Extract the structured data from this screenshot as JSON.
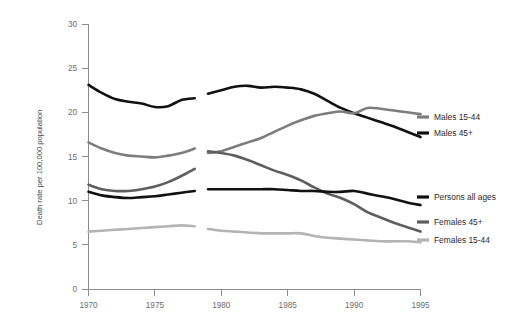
{
  "chart_data": {
    "type": "line",
    "title": "",
    "subtitle": "",
    "xlabel": "",
    "ylabel": "Death rate per 100,000 population",
    "xlim": [
      1970,
      1995
    ],
    "ylim": [
      0,
      30
    ],
    "xticks": [
      1970,
      1975,
      1980,
      1985,
      1990,
      1995
    ],
    "xtick_labels": [
      "1970",
      "1975",
      "1980",
      "1985",
      "1990",
      "1995"
    ],
    "yticks": [
      0,
      5,
      10,
      15,
      20,
      25,
      30
    ],
    "ytick_labels": [
      "0",
      "5",
      "10",
      "15",
      "20",
      "25",
      "30"
    ],
    "grid": false,
    "legend_position": "right",
    "discontinuity": {
      "note": "series are broken between 1978 and 1979",
      "break_start": 1978.0,
      "break_end": 1979.0
    },
    "x": [
      1970,
      1971,
      1972,
      1973,
      1974,
      1975,
      1976,
      1977,
      1978,
      1979,
      1980,
      1981,
      1982,
      1983,
      1984,
      1985,
      1986,
      1987,
      1988,
      1989,
      1990,
      1991,
      1992,
      1993,
      1994,
      1995
    ],
    "series": [
      {
        "name": "Males 45+",
        "color": "#111111",
        "values": [
          23.1,
          22.2,
          21.5,
          21.2,
          21.0,
          20.6,
          20.7,
          21.4,
          21.6,
          22.1,
          22.5,
          22.9,
          23.0,
          22.8,
          22.9,
          22.8,
          22.6,
          22.1,
          21.3,
          20.5,
          19.9,
          19.4,
          18.9,
          18.4,
          17.8,
          17.2
        ]
      },
      {
        "name": "Males 15-44",
        "color": "#7d7d7d",
        "values": [
          16.6,
          15.9,
          15.4,
          15.1,
          15.0,
          14.9,
          15.1,
          15.4,
          15.9,
          15.4,
          15.6,
          16.1,
          16.6,
          17.1,
          17.8,
          18.5,
          19.1,
          19.6,
          19.9,
          20.1,
          19.9,
          20.5,
          20.4,
          20.2,
          20.0,
          19.8
        ]
      },
      {
        "name": "Females 45+",
        "color": "#5e5e5e",
        "values": [
          11.8,
          11.3,
          11.1,
          11.1,
          11.3,
          11.6,
          12.1,
          12.8,
          13.6,
          15.6,
          15.4,
          15.1,
          14.6,
          14.0,
          13.4,
          12.9,
          12.3,
          11.5,
          10.8,
          10.3,
          9.6,
          8.7,
          8.1,
          7.5,
          7.0,
          6.5
        ]
      },
      {
        "name": "Persons all ages",
        "color": "#111111",
        "values": [
          11.0,
          10.6,
          10.4,
          10.3,
          10.4,
          10.5,
          10.7,
          10.9,
          11.1,
          11.3,
          11.3,
          11.3,
          11.3,
          11.3,
          11.3,
          11.2,
          11.1,
          11.1,
          11.0,
          11.0,
          11.1,
          10.8,
          10.5,
          10.2,
          9.8,
          9.5
        ]
      },
      {
        "name": "Females 15-44",
        "color": "#b4b4b4",
        "values": [
          6.5,
          6.6,
          6.7,
          6.8,
          6.9,
          7.0,
          7.1,
          7.2,
          7.1,
          6.8,
          6.6,
          6.5,
          6.4,
          6.3,
          6.3,
          6.3,
          6.3,
          6.0,
          5.8,
          5.7,
          5.6,
          5.5,
          5.4,
          5.4,
          5.4,
          5.3
        ]
      }
    ],
    "legend": [
      {
        "label": "Males 15-44",
        "color": "#7d7d7d"
      },
      {
        "label": "Males 45+",
        "color": "#111111"
      },
      {
        "label": "Persons all ages",
        "color": "#111111"
      },
      {
        "label": "Females 45+",
        "color": "#5e5e5e"
      },
      {
        "label": "Females 15-44",
        "color": "#b4b4b4"
      }
    ]
  }
}
